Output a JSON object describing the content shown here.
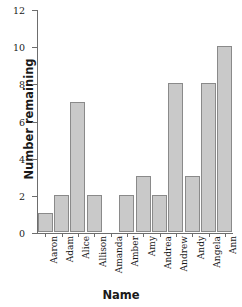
{
  "chart_data": {
    "type": "bar",
    "title": "",
    "xlabel": "Name",
    "ylabel": "Number remaining",
    "categories": [
      "Aaron",
      "Adam",
      "Alice",
      "Allison",
      "Amanda",
      "Amber",
      "Amy",
      "Andrea",
      "Andrew",
      "Andy",
      "Angela",
      "Ann"
    ],
    "values": [
      1,
      2,
      7,
      2,
      0,
      2,
      3,
      2,
      8,
      3,
      8,
      10
    ],
    "ylim": [
      0,
      12
    ],
    "ytick_labels": [
      "0",
      "2",
      "4",
      "6",
      "8",
      "10",
      "12"
    ],
    "ytick_values": [
      0,
      2,
      4,
      6,
      8,
      10,
      12
    ],
    "grid": false,
    "legend": false,
    "bar_color": "#c9c9c9",
    "bar_edge_color": "#8a8a8a",
    "axis_color": "#6d6d6d"
  }
}
